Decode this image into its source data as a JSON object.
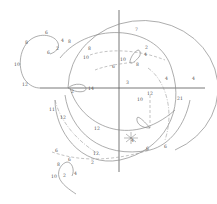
{
  "diagram": {
    "type": "hodograph-orbit-curves",
    "axes": {
      "origin": [
        117,
        88
      ]
    },
    "labels": [
      {
        "text": "6",
        "x": 45,
        "y": 34
      },
      {
        "text": "8",
        "x": 25,
        "y": 44
      },
      {
        "text": "10",
        "x": 14,
        "y": 66
      },
      {
        "text": "12",
        "x": 22,
        "y": 86
      },
      {
        "text": "4",
        "x": 61,
        "y": 42
      },
      {
        "text": "2",
        "x": 56,
        "y": 50
      },
      {
        "text": "6",
        "x": 47,
        "y": 54
      },
      {
        "text": "8",
        "x": 68,
        "y": 43
      },
      {
        "text": "8",
        "x": 88,
        "y": 50
      },
      {
        "text": "10",
        "x": 83,
        "y": 59
      },
      {
        "text": "14",
        "x": 88,
        "y": 90
      },
      {
        "text": "2",
        "x": 71,
        "y": 93
      },
      {
        "text": "7",
        "x": 135,
        "y": 31
      },
      {
        "text": "2",
        "x": 145,
        "y": 49
      },
      {
        "text": "4",
        "x": 144,
        "y": 56
      },
      {
        "text": "8",
        "x": 136,
        "y": 66
      },
      {
        "text": "10",
        "x": 120,
        "y": 61
      },
      {
        "text": "6",
        "x": 112,
        "y": 68
      },
      {
        "text": "3",
        "x": 126,
        "y": 84
      },
      {
        "text": "4",
        "x": 165,
        "y": 80
      },
      {
        "text": "4",
        "x": 192,
        "y": 80
      },
      {
        "text": "12",
        "x": 147,
        "y": 95
      },
      {
        "text": "21",
        "x": 177,
        "y": 100
      },
      {
        "text": "10",
        "x": 137,
        "y": 101
      },
      {
        "text": "11",
        "x": 49,
        "y": 111
      },
      {
        "text": "12",
        "x": 60,
        "y": 119
      },
      {
        "text": "12",
        "x": 94,
        "y": 130
      },
      {
        "text": "12",
        "x": 93,
        "y": 155
      },
      {
        "text": "6",
        "x": 55,
        "y": 152
      },
      {
        "text": "2",
        "x": 91,
        "y": 164
      },
      {
        "text": "6",
        "x": 68,
        "y": 161
      },
      {
        "text": "8",
        "x": 57,
        "y": 166
      },
      {
        "text": "10",
        "x": 51,
        "y": 178
      },
      {
        "text": "2",
        "x": 63,
        "y": 177
      },
      {
        "text": "4",
        "x": 74,
        "y": 175
      },
      {
        "text": "6",
        "x": 164,
        "y": 148
      },
      {
        "text": "6",
        "x": 146,
        "y": 150
      },
      {
        "text": "4",
        "x": 131,
        "y": 142
      }
    ]
  }
}
